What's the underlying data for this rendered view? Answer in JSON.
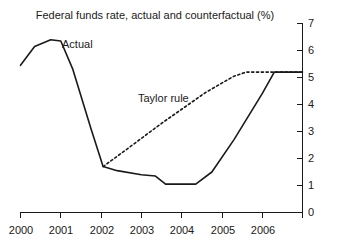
{
  "chart_data": {
    "type": "line",
    "title": "Federal funds rate, actual and counterfactual (%)",
    "xlabel": "",
    "ylabel": "",
    "ylim": [
      0,
      7
    ],
    "xlim": [
      2000,
      2007
    ],
    "grid": false,
    "yaxis_position": "right",
    "legend_position": "inline-annotation",
    "yticks": [
      "0",
      "1",
      "2",
      "3",
      "4",
      "5",
      "6",
      "7"
    ],
    "ytick_values": [
      0,
      1,
      2,
      3,
      4,
      5,
      6,
      7
    ],
    "xticks": [
      "2000",
      "2001",
      "2002",
      "2003",
      "2004",
      "2005",
      "2006"
    ],
    "xtick_values": [
      2000,
      2001,
      2002,
      2003,
      2004,
      2005,
      2006
    ],
    "series": [
      {
        "name": "Actual",
        "style": "solid",
        "color": "#1a1a1a",
        "x": [
          2000.0,
          2000.35,
          2000.75,
          2001.0,
          2001.3,
          2001.75,
          2002.05,
          2002.4,
          2003.0,
          2003.35,
          2003.6,
          2004.35,
          2004.75,
          2005.3,
          2006.0,
          2006.3,
          2007.0
        ],
        "values": [
          5.45,
          6.15,
          6.4,
          6.35,
          5.3,
          3.1,
          1.7,
          1.55,
          1.4,
          1.35,
          1.05,
          1.05,
          1.5,
          2.7,
          4.4,
          5.2,
          5.2
        ]
      },
      {
        "name": "Taylor rule",
        "style": "dashed",
        "color": "#1a1a1a",
        "x": [
          2002.05,
          2002.6,
          2003.5,
          2004.6,
          2005.3,
          2005.6,
          2006.3,
          2007.0
        ],
        "values": [
          1.7,
          2.3,
          3.3,
          4.45,
          5.05,
          5.2,
          5.2,
          5.2
        ]
      }
    ],
    "annotations": [
      {
        "text": "Actual",
        "x": 2001.05,
        "y": 6.35
      },
      {
        "text": "Taylor rule",
        "x": 2003.0,
        "y": 4.05
      }
    ]
  }
}
